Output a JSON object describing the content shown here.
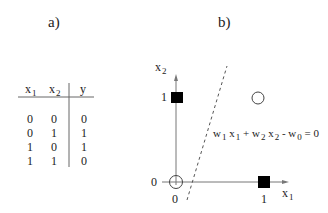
{
  "panels": {
    "a": {
      "label": "a)"
    },
    "b": {
      "label": "b)"
    }
  },
  "truth_table": {
    "columns": [
      {
        "base": "x",
        "sub": "1"
      },
      {
        "base": "x",
        "sub": "2"
      },
      {
        "base": "y",
        "sub": ""
      }
    ],
    "rows": [
      [
        "0",
        "0",
        "0"
      ],
      [
        "0",
        "1",
        "1"
      ],
      [
        "1",
        "0",
        "1"
      ],
      [
        "1",
        "1",
        "0"
      ]
    ]
  },
  "plot": {
    "x_axis": {
      "base": "x",
      "sub": "1",
      "ticks": [
        "0",
        "1"
      ]
    },
    "y_axis": {
      "base": "x",
      "sub": "2",
      "ticks": [
        "0",
        "1"
      ]
    },
    "points": [
      {
        "x": 0,
        "y": 0,
        "marker": "open-circle"
      },
      {
        "x": 0,
        "y": 1,
        "marker": "filled-square"
      },
      {
        "x": 1,
        "y": 0,
        "marker": "filled-square"
      },
      {
        "x": 1,
        "y": 1,
        "marker": "open-circle"
      }
    ],
    "decision_boundary": {
      "style": "dashed",
      "equation": {
        "w1": "w",
        "w1_sub": "1",
        "x1": "x",
        "x1_sub": "1",
        "plus": "+",
        "w2": "w",
        "w2_sub": "2",
        "x2": "x",
        "x2_sub": "2",
        "minus": "-",
        "w0": "w",
        "w0_sub": "0",
        "eq": "= 0"
      }
    }
  }
}
